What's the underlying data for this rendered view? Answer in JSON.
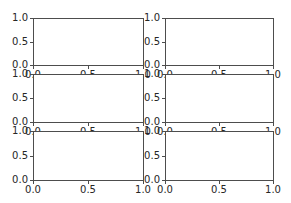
{
  "chart_data": [
    {
      "type": "line",
      "position": "row1-col1",
      "title": "",
      "xlabel": "",
      "ylabel": "",
      "xlim": [
        0,
        1
      ],
      "ylim": [
        0,
        1
      ],
      "xticks": [
        "0.0",
        "0.5",
        "1.0"
      ],
      "yticks": [
        "0.0",
        "0.5",
        "1.0"
      ],
      "series": [],
      "grid": false
    },
    {
      "type": "line",
      "position": "row1-col2",
      "title": "",
      "xlabel": "",
      "ylabel": "",
      "xlim": [
        0,
        1
      ],
      "ylim": [
        0,
        1
      ],
      "xticks": [
        "0.0",
        "0.5",
        "1.0"
      ],
      "yticks": [
        "0.0",
        "0.5",
        "1.0"
      ],
      "series": [],
      "grid": false
    },
    {
      "type": "line",
      "position": "row2-col1",
      "title": "",
      "xlabel": "",
      "ylabel": "",
      "xlim": [
        0,
        1
      ],
      "ylim": [
        0,
        1
      ],
      "xticks": [
        "0.0",
        "0.5",
        "1.0"
      ],
      "yticks": [
        "0.0",
        "0.5",
        "1.0"
      ],
      "series": [],
      "grid": false
    },
    {
      "type": "line",
      "position": "row2-col2",
      "title": "",
      "xlabel": "",
      "ylabel": "",
      "xlim": [
        0,
        1
      ],
      "ylim": [
        0,
        1
      ],
      "xticks": [
        "0.0",
        "0.5",
        "1.0"
      ],
      "yticks": [
        "0.0",
        "0.5",
        "1.0"
      ],
      "series": [],
      "grid": false
    },
    {
      "type": "line",
      "position": "row3-col1",
      "title": "",
      "xlabel": "",
      "ylabel": "",
      "xlim": [
        0,
        1
      ],
      "ylim": [
        0,
        1
      ],
      "xticks": [
        "0.0",
        "0.5",
        "1.0"
      ],
      "yticks": [
        "0.0",
        "0.5",
        "1.0"
      ],
      "series": [],
      "grid": false
    },
    {
      "type": "line",
      "position": "row3-col2",
      "title": "",
      "xlabel": "",
      "ylabel": "",
      "xlim": [
        0,
        1
      ],
      "ylim": [
        0,
        1
      ],
      "xticks": [
        "0.0",
        "0.5",
        "1.0"
      ],
      "yticks": [
        "0.0",
        "0.5",
        "1.0"
      ],
      "series": [],
      "grid": false
    }
  ],
  "ticks": {
    "x": [
      "0.0",
      "0.5",
      "1.0"
    ],
    "y": [
      "0.0",
      "0.5",
      "1.0"
    ]
  },
  "layout": {
    "rows": 3,
    "cols": 2,
    "axis_color": "#4d4d4d",
    "label_color": "#262626"
  }
}
